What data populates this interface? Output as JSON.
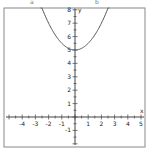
{
  "header": {
    "left_mark": "a",
    "right_mark": "b"
  },
  "chart_data": {
    "type": "line",
    "title": "",
    "xlabel": "x",
    "ylabel": "y",
    "xlim": [
      -5,
      5
    ],
    "ylim": [
      -2,
      8
    ],
    "x_ticks": [
      -4,
      -3,
      -2,
      -1,
      1,
      2,
      3,
      4,
      5
    ],
    "y_ticks": [
      -1,
      1,
      2,
      3,
      4,
      5,
      6,
      7,
      8
    ],
    "grid": false,
    "legend": null,
    "series": [
      {
        "name": "y = 0.5x^2 + 5",
        "x": [
          -2.45,
          -2,
          -1.5,
          -1,
          -0.5,
          0,
          0.5,
          1,
          1.5,
          2,
          2.45
        ],
        "values": [
          8.0,
          7.0,
          6.125,
          5.5,
          5.125,
          5.0,
          5.125,
          5.5,
          6.125,
          7.0,
          8.0
        ]
      }
    ],
    "vertex": {
      "x": 0,
      "y": 5
    },
    "colors": {
      "curve": "#555555",
      "axis": "#444444",
      "frame": "#888888"
    }
  }
}
